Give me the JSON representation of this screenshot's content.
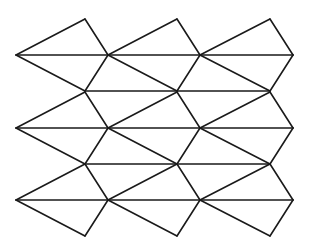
{
  "figure": {
    "title": "",
    "stroke_color": "#1a1a1a",
    "background": "#ffffff"
  },
  "geometry": {
    "row_centers": [
      55,
      128,
      200
    ],
    "tip_x": [
      16,
      108,
      200,
      293
    ],
    "apex_x": [
      85,
      177,
      270
    ],
    "apex_offset": 36,
    "inner_horizontals": [
      {
        "y": 91,
        "x1": 85,
        "x2": 270
      },
      {
        "y": 164,
        "x1": 85,
        "x2": 270
      }
    ]
  }
}
